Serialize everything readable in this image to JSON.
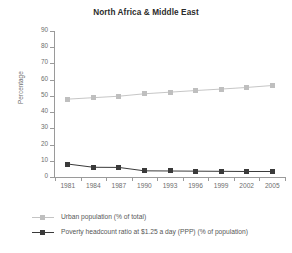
{
  "chart_data": {
    "type": "line",
    "title": "North Africa & Middle East",
    "xlabel": "",
    "ylabel": "Percentage",
    "categories": [
      "1981",
      "1984",
      "1987",
      "1990",
      "1993",
      "1996",
      "1999",
      "2002",
      "2005"
    ],
    "ylim": [
      0,
      90
    ],
    "yticks": [
      0,
      10,
      20,
      30,
      40,
      50,
      60,
      70,
      80,
      90
    ],
    "ytick_labels": [
      "0",
      "10",
      "20",
      "30",
      "40",
      "50",
      "60",
      "70",
      "80",
      "90"
    ],
    "grid": false,
    "legend_position": "bottom-left",
    "series": [
      {
        "name": "Urban population (% of total)",
        "color": "#bfbfbf",
        "marker": "square",
        "values": [
          48.0,
          48.9,
          49.8,
          51.3,
          52.3,
          53.3,
          54.2,
          55.2,
          56.4
        ]
      },
      {
        "name": "Poverty headcount ratio at $1.25 a day (PPP) (% of population)",
        "color": "#3a3a3a",
        "marker": "square",
        "values": [
          8.0,
          6.0,
          5.9,
          3.8,
          3.7,
          3.6,
          3.5,
          3.4,
          3.4
        ]
      }
    ]
  },
  "legend": {
    "items": [
      {
        "label": "Urban population (% of total)"
      },
      {
        "label": "Poverty headcount ratio at $1.25 a day (PPP) (% of population)"
      }
    ]
  }
}
